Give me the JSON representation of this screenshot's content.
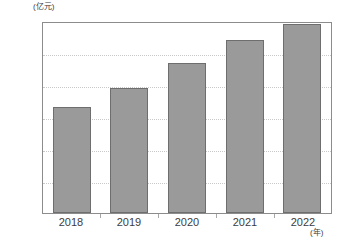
{
  "chart_data": {
    "type": "bar",
    "title": "",
    "subtitle": "",
    "xlabel": "(年)",
    "ylabel": "(亿元)",
    "categories": [
      "2018",
      "2019",
      "2020",
      "2021",
      "2022"
    ],
    "values": [
      33,
      39,
      47,
      54,
      59
    ],
    "series": [
      {
        "name": "",
        "values": [
          33,
          39,
          47,
          54,
          59
        ]
      }
    ],
    "ylim": [
      0,
      60
    ],
    "yticks": [
      0,
      10,
      20,
      30,
      40,
      50,
      60
    ],
    "ytick_labels": [
      "0",
      "10",
      "20",
      "30",
      "40",
      "50",
      "60"
    ],
    "grid": true,
    "grid_axis": "y",
    "legend": false,
    "legend_position": "none",
    "bar_color": "#9a9a9a",
    "bar_edge_color": "#6e6e6e",
    "grid_color": "#c9c9c9",
    "frame_color": "#8c8c8c",
    "text_color": "#3c3c3c",
    "annotations": []
  },
  "axes": {
    "y_unit": "(亿元)",
    "x_unit": "(年)"
  }
}
